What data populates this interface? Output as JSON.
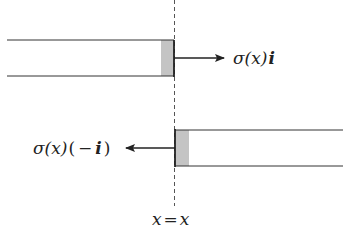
{
  "diagram": {
    "upper_force_label": {
      "sigma": "σ(x)",
      "vector": "i"
    },
    "lower_force_label": {
      "sigma": "σ(x)",
      "open": "(",
      "minus": "−",
      "vector": "i",
      "close": ")"
    },
    "section_label": {
      "left": "x",
      "eq": "=",
      "right": "x"
    },
    "colors": {
      "line": "#333333",
      "shade": "#bdbdbd",
      "dash": "#555555"
    }
  }
}
